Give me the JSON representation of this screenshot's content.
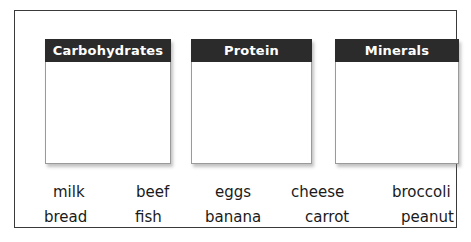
{
  "worksheet": {
    "categories": [
      {
        "id": "carbohydrates",
        "label": "Carbohydrates"
      },
      {
        "id": "protein",
        "label": "Protein"
      },
      {
        "id": "minerals",
        "label": "Minerals"
      }
    ],
    "word_bank": {
      "row1": [
        "milk",
        "beef",
        "eggs",
        "cheese",
        "broccoli"
      ],
      "row2": [
        "bread",
        "fish",
        "banana",
        "carrot",
        "peanut"
      ]
    }
  },
  "colors": {
    "header_bar": "#2b2b2b",
    "header_text": "#ffffff",
    "frame_border": "#3a3a3a",
    "card_border": "#9a9a9a",
    "word_text": "#1a1a1a",
    "background": "#ffffff"
  }
}
